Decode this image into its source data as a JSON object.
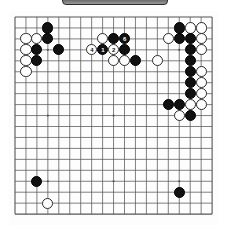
{
  "app": {
    "title_bar_label": "",
    "board_name": "go-board"
  },
  "board": {
    "size": 19,
    "line_color": "#555555",
    "background_color": "#fdfdfd",
    "black_color": "#111111",
    "white_color": "#ffffff",
    "origin_x": 6,
    "origin_y": 6,
    "step": 10.95,
    "star_points": [
      [
        3,
        3
      ],
      [
        9,
        3
      ],
      [
        15,
        3
      ],
      [
        3,
        9
      ],
      [
        9,
        9
      ],
      [
        15,
        9
      ],
      [
        3,
        15
      ],
      [
        9,
        15
      ],
      [
        15,
        15
      ]
    ],
    "stones": [
      {
        "c": "b",
        "x": 3,
        "y": 1,
        "label": ""
      },
      {
        "c": "w",
        "x": 1,
        "y": 2,
        "label": ""
      },
      {
        "c": "w",
        "x": 2,
        "y": 2,
        "label": ""
      },
      {
        "c": "b",
        "x": 3,
        "y": 2,
        "label": ""
      },
      {
        "c": "w",
        "x": 1,
        "y": 3,
        "label": ""
      },
      {
        "c": "b",
        "x": 2,
        "y": 3,
        "label": ""
      },
      {
        "c": "b",
        "x": 4,
        "y": 3,
        "label": ""
      },
      {
        "c": "w",
        "x": 1,
        "y": 4,
        "label": ""
      },
      {
        "c": "b",
        "x": 2,
        "y": 4,
        "label": ""
      },
      {
        "c": "w",
        "x": 1,
        "y": 5,
        "label": ""
      },
      {
        "c": "w",
        "x": 8,
        "y": 2,
        "label": ""
      },
      {
        "c": "b",
        "x": 9,
        "y": 2,
        "label": ""
      },
      {
        "c": "b",
        "x": 10,
        "y": 2,
        "label": "6"
      },
      {
        "c": "w",
        "x": 7,
        "y": 3,
        "label": "4"
      },
      {
        "c": "b",
        "x": 8,
        "y": 3,
        "label": "1"
      },
      {
        "c": "w",
        "x": 9,
        "y": 3,
        "label": "2"
      },
      {
        "c": "b",
        "x": 10,
        "y": 3,
        "label": ""
      },
      {
        "c": "w",
        "x": 9,
        "y": 4,
        "label": ""
      },
      {
        "c": "w",
        "x": 10,
        "y": 4,
        "label": ""
      },
      {
        "c": "b",
        "x": 11,
        "y": 4,
        "label": ""
      },
      {
        "c": "w",
        "x": 13,
        "y": 4,
        "label": ""
      },
      {
        "c": "b",
        "x": 15,
        "y": 1,
        "label": ""
      },
      {
        "c": "w",
        "x": 16,
        "y": 1,
        "label": ""
      },
      {
        "c": "w",
        "x": 17,
        "y": 1,
        "label": ""
      },
      {
        "c": "w",
        "x": 14,
        "y": 2,
        "label": ""
      },
      {
        "c": "b",
        "x": 15,
        "y": 2,
        "label": ""
      },
      {
        "c": "b",
        "x": 16,
        "y": 2,
        "label": ""
      },
      {
        "c": "w",
        "x": 17,
        "y": 2,
        "label": ""
      },
      {
        "c": "b",
        "x": 16,
        "y": 3,
        "label": ""
      },
      {
        "c": "w",
        "x": 17,
        "y": 3,
        "label": ""
      },
      {
        "c": "b",
        "x": 16,
        "y": 4,
        "label": ""
      },
      {
        "c": "b",
        "x": 16,
        "y": 5,
        "label": ""
      },
      {
        "c": "w",
        "x": 17,
        "y": 5,
        "label": ""
      },
      {
        "c": "b",
        "x": 16,
        "y": 6,
        "label": ""
      },
      {
        "c": "w",
        "x": 17,
        "y": 6,
        "label": ""
      },
      {
        "c": "b",
        "x": 16,
        "y": 7,
        "label": ""
      },
      {
        "c": "w",
        "x": 17,
        "y": 7,
        "label": ""
      },
      {
        "c": "b",
        "x": 14,
        "y": 8,
        "label": ""
      },
      {
        "c": "b",
        "x": 15,
        "y": 8,
        "label": ""
      },
      {
        "c": "w",
        "x": 16,
        "y": 8,
        "label": ""
      },
      {
        "c": "w",
        "x": 17,
        "y": 8,
        "label": ""
      },
      {
        "c": "w",
        "x": 15,
        "y": 9,
        "label": ""
      },
      {
        "c": "b",
        "x": 16,
        "y": 9,
        "label": ""
      },
      {
        "c": "b",
        "x": 2,
        "y": 15,
        "label": ""
      },
      {
        "c": "w",
        "x": 3,
        "y": 17,
        "label": ""
      },
      {
        "c": "b",
        "x": 15,
        "y": 16,
        "label": ""
      }
    ]
  },
  "legend": {
    "black_label": "Black",
    "white_label": "White"
  }
}
